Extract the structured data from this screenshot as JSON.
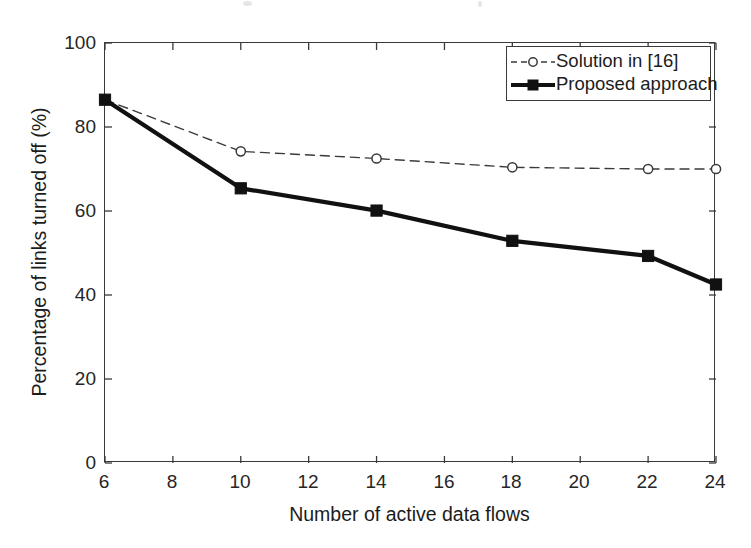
{
  "chart_data": {
    "type": "line",
    "title": "",
    "xlabel": "Number of active data flows",
    "ylabel": "Percentage of links turned off (%)",
    "xlim": [
      6,
      24
    ],
    "ylim": [
      0,
      100
    ],
    "xticks": [
      6,
      8,
      10,
      12,
      14,
      16,
      18,
      20,
      22,
      24
    ],
    "yticks": [
      0,
      20,
      40,
      60,
      80,
      100
    ],
    "xtick_labels": [
      "6",
      "8",
      "10",
      "12",
      "14",
      "16",
      "18",
      "20",
      "22",
      "24"
    ],
    "ytick_labels": [
      "0",
      "20",
      "40",
      "60",
      "80",
      "100"
    ],
    "grid": false,
    "legend_position": "top-right",
    "x": [
      6,
      10,
      14,
      18,
      22,
      24
    ],
    "series": [
      {
        "name": "Solution in [16]",
        "values": [
          86.5,
          74.2,
          72.5,
          70.4,
          70.0,
          70.0
        ],
        "line_style": "dashed",
        "marker": "circle",
        "color": "#3a3a3a",
        "line_width": 1.4
      },
      {
        "name": "Proposed approach",
        "values": [
          86.5,
          65.4,
          60.1,
          52.9,
          49.3,
          42.5
        ],
        "line_style": "solid",
        "marker": "square",
        "color": "#111111",
        "line_width": 4.2
      }
    ]
  },
  "legend": {
    "entries": [
      {
        "label": "Solution in [16]",
        "marker": "circle-marker",
        "style": "dashed"
      },
      {
        "label": "Proposed approach",
        "marker": "square-marker",
        "style": "solid"
      }
    ]
  },
  "colors": {
    "axis": "#3a3a3a",
    "background": "#ffffff",
    "series_dashed": "#3a3a3a",
    "series_solid": "#111111",
    "text": "#1c1c1c"
  }
}
